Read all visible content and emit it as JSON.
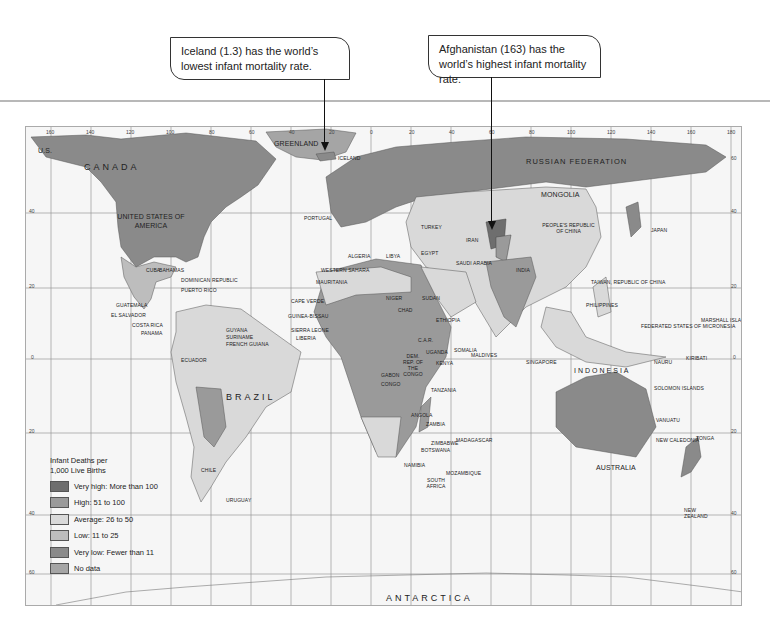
{
  "callouts": [
    {
      "id": "iceland",
      "text": "Iceland (1.3) has the world’s lowest infant mortality rate."
    },
    {
      "id": "afghanistan",
      "text": "Afghanistan (163) has the world’s highest infant mortality rate."
    }
  ],
  "legend": {
    "title_line1": "Infant Deaths per",
    "title_line2": "1,000 Live Births",
    "items": [
      {
        "label": "Very high: More than 100",
        "color": "#6e6e6e"
      },
      {
        "label": "High: 51 to 100",
        "color": "#9a9a9a"
      },
      {
        "label": "Average: 26 to 50",
        "color": "#d9d9d9"
      },
      {
        "label": "Low: 11 to 25",
        "color": "#bdbdbd"
      },
      {
        "label": "Very low: Fewer than 11",
        "color": "#8a8a8a"
      },
      {
        "label": "No data",
        "color": "#a5a5a5"
      }
    ]
  },
  "map": {
    "longitude_ticks": [
      "160",
      "140",
      "120",
      "100",
      "80",
      "60",
      "40",
      "20",
      "0",
      "20",
      "40",
      "60",
      "80",
      "100",
      "120",
      "140",
      "160",
      "180"
    ],
    "latitude_ticks": [
      "60",
      "40",
      "20",
      "0",
      "20",
      "40",
      "60"
    ],
    "region_labels": {
      "canada": "CANADA",
      "usa": "UNITED STATES OF AMERICA",
      "us_alaska": "U.S.",
      "greenland": "GREENLAND",
      "iceland": "ICELAND",
      "russia": "RUSSIAN FEDERATION",
      "mongolia": "MONGOLIA",
      "china": "PEOPLE'S REPUBLIC OF CHINA",
      "japan": "JAPAN",
      "brazil": "BRAZIL",
      "peru": "PERU",
      "ecuador": "ECUADOR",
      "chile": "CHILE",
      "argentina": "ARGENTINA",
      "uruguay": "URUGUAY",
      "bolivia": "BOLIVIA",
      "colombia": "COLOMBIA",
      "venezuela": "VENEZUELA",
      "mexico": "MEXICO",
      "cuba": "CUBA",
      "bahamas": "BAHAMAS",
      "guatemala": "GUATEMALA",
      "el_salvador": "EL SALVADOR",
      "costa_rica": "COSTA RICA",
      "panama": "PANAMA",
      "nicaragua": "NICARAGUA",
      "honduras": "HONDURAS",
      "belize": "BELIZE",
      "jamaica": "JAMAICA",
      "dominican_republic": "DOMINICAN REPUBLIC",
      "puerto_rico": "PUERTO RICO",
      "guyana": "GUYANA",
      "suriname": "SURINAME",
      "french_guiana": "FRENCH GUIANA",
      "algeria": "ALGERIA",
      "libya": "LIBYA",
      "egypt": "EGYPT",
      "mali": "MALI",
      "niger": "NIGER",
      "chad": "CHAD",
      "sudan": "SUDAN",
      "ethiopia": "ETHIOPIA",
      "somalia": "SOMALIA",
      "kenya": "KENYA",
      "uganda": "UGANDA",
      "tanzania": "TANZANIA",
      "car": "C.A.R.",
      "drc": "DEM. REP. OF THE CONGO",
      "congo": "CONGO",
      "gabon": "GABON",
      "angola": "ANGOLA",
      "zambia": "ZAMBIA",
      "namibia": "NAMIBIA",
      "botswana": "BOTSWANA",
      "south_africa": "SOUTH AFRICA",
      "mozambique": "MOZAMBIQUE",
      "madagascar": "MADAGASCAR",
      "zimbabwe": "ZIMBABWE",
      "nigeria": "NIGERIA",
      "mauritania": "MAURITANIA",
      "western_sahara": "WESTERN SAHARA",
      "senegal": "SENEGAL",
      "gambia": "GAMBIA",
      "guinea_bissau": "GUINEA-BISSAU",
      "guinea": "GUINEA",
      "sierra_leone": "SIERRA LEONE",
      "liberia": "LIBERIA",
      "cape_verde": "CAPE VERDE",
      "saudi_arabia": "SAUDI ARABIA",
      "iran": "IRAN",
      "iraq": "IRAQ",
      "turkey": "TURKEY",
      "india": "INDIA",
      "pakistan": "PAKISTAN",
      "afghanistan": "AFGHANISTAN",
      "kazakhstan": "KAZAKHSTAN",
      "oman": "OMAN",
      "thailand": "THAILAND",
      "vietnam": "VIETNAM",
      "philippines": "PHILIPPINES",
      "indonesia": "INDONESIA",
      "australia": "AUSTRALIA",
      "new_zealand": "NEW ZEALAND",
      "papua_new_guinea": "PAPUA NEW GUINEA",
      "sri_lanka": "SRI LANKA",
      "malaysia": "MALAYSIA",
      "portugal": "PORTUGAL",
      "spain": "SPAIN",
      "france": "FRANCE",
      "ireland": "IRELAND",
      "norway": "NORWAY",
      "finland": "FINLAND",
      "poland": "POLAND",
      "ukraine": "UKRAINE",
      "antarctica": "ANTARCTICA",
      "micronesia": "FEDERATED STATES OF MICRONESIA",
      "marshall": "MARSHALL ISLANDS",
      "kiribati": "KIRIBATI",
      "nauru": "NAURU",
      "solomon": "SOLOMON ISLANDS",
      "vanuatu": "VANUATU",
      "fiji": "FIJI",
      "tonga": "TONGA",
      "new_caledonia": "NEW CALEDONIA",
      "samoa": "WESTERN SAMOA",
      "tuvalu": "TUVALU",
      "taiwan": "TAIWAN, REPUBLIC OF CHINA",
      "seychelles": "SEYCHELLES",
      "maldives": "MALDIVES",
      "comoros": "COMOROS",
      "singapore": "SINGAPORE",
      "east_timor": "EAST TIMOR"
    }
  }
}
